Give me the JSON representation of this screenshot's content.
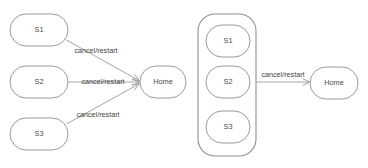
{
  "canvas": {
    "width": 368,
    "height": 168,
    "background": "#ffffff",
    "stroke_color": "#9a9a9a",
    "text_color": "#3f3f3f"
  },
  "diagram": {
    "type": "state-transition-diagram",
    "edge_label_text": "cancel/restart",
    "left_group": {
      "name": "expanded-transitions",
      "states": [
        {
          "id": "s1",
          "label": "S1",
          "x": 10,
          "y": 14,
          "w": 58,
          "h": 32
        },
        {
          "id": "s2",
          "label": "S2",
          "x": 10,
          "y": 66,
          "w": 58,
          "h": 32
        },
        {
          "id": "s3",
          "label": "S3",
          "x": 10,
          "y": 118,
          "w": 58,
          "h": 32
        }
      ],
      "target": {
        "id": "home-left",
        "label": "Home",
        "x": 140,
        "y": 66,
        "w": 46,
        "h": 32
      },
      "edges": [
        {
          "from": "s1",
          "to": "home-left",
          "label": "cancel/restart",
          "label_x": 96,
          "label_y": 51
        },
        {
          "from": "s2",
          "to": "home-left",
          "label": "cancel/restart",
          "label_x": 103,
          "label_y": 82
        },
        {
          "from": "s3",
          "to": "home-left",
          "label": "cancel/restart",
          "label_x": 98,
          "label_y": 115
        }
      ]
    },
    "right_group": {
      "name": "grouped-transitions",
      "container": {
        "id": "state-group",
        "x": 198,
        "y": 14,
        "w": 58,
        "h": 142
      },
      "states": [
        {
          "id": "s1",
          "label": "S1",
          "x": 206,
          "y": 25,
          "w": 44,
          "h": 32
        },
        {
          "id": "s2",
          "label": "S2",
          "x": 206,
          "y": 66,
          "w": 44,
          "h": 32
        },
        {
          "id": "s3",
          "label": "S3",
          "x": 206,
          "y": 111,
          "w": 44,
          "h": 32
        }
      ],
      "target": {
        "id": "home-right",
        "label": "Home",
        "x": 310,
        "y": 67,
        "w": 48,
        "h": 32
      },
      "edges": [
        {
          "from": "state-group",
          "to": "home-right",
          "label": "cancel/restart",
          "label_x": 283,
          "label_y": 76
        }
      ]
    }
  },
  "labels": {
    "left_s1": "S1",
    "left_s2": "S2",
    "left_s3": "S3",
    "left_home": "Home",
    "right_s1": "S1",
    "right_s2": "S2",
    "right_s3": "S3",
    "right_home": "Home",
    "edge_left_top": "cancel/restart",
    "edge_left_middle": "cancel/restart",
    "edge_left_bottom": "cancel/restart",
    "edge_right": "cancel/restart"
  }
}
